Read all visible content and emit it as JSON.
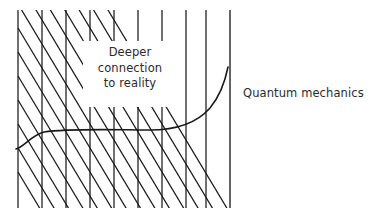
{
  "diagram": {
    "title_text_inside": "Deeper\nconnection\nto reality",
    "inner_label_lines": [
      "Deeper",
      "connection",
      "to reality"
    ],
    "outer_label": "Quantum mechanics",
    "colors": {
      "ink": "#1a1a1a",
      "text": "#2b2b2b",
      "background": "#ffffff"
    },
    "region": {
      "name": "hatched-region",
      "left": 18,
      "right": 230,
      "top": 10,
      "bottom": 208,
      "hatch_style": "vertical-lines-with-down-right-diagonals",
      "vertical_spacing": 24,
      "vertical_positions": [
        18,
        42,
        66,
        90,
        114,
        138,
        162,
        186,
        206,
        230
      ],
      "diagonal_drop": 40
    },
    "curve": {
      "name": "quantum-mechanics-curve",
      "description": "rises from lower left, flattens across a long plateau, then sweeps steeply upward at the right edge",
      "start": [
        16,
        148
      ],
      "plateau_y": 131,
      "end": [
        228,
        68
      ]
    }
  }
}
